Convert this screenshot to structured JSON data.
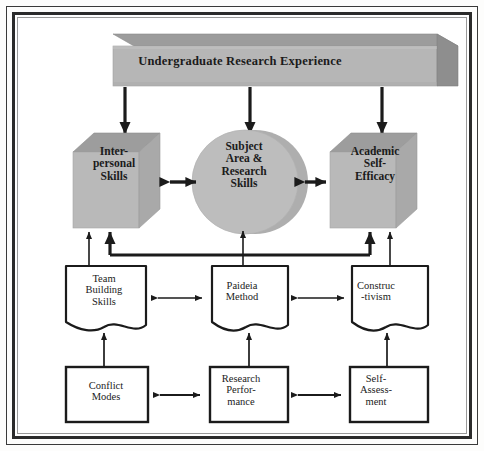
{
  "diagram": {
    "colors": {
      "slab_front": "#b7b7b7",
      "slab_top": "#9a9a9a",
      "slab_side": "#8d8d8d",
      "cube_front": "#b9b9b9",
      "cube_top": "#9d9d9d",
      "cube_side": "#a8a8a8",
      "cylinder_fill": "#bdbdbd",
      "cylinder_shadow": "#a6a6a6",
      "doc_fill": "#ffffff",
      "stroke": "#1b1b1b",
      "frame": "#2b2b2b",
      "text": "#1b1b1b"
    },
    "top_node": {
      "id": "undergraduate-research-experience",
      "label": "Undergraduate Research Experience",
      "shape": "3d-slab"
    },
    "outcome_nodes": [
      {
        "id": "interpersonal-skills",
        "label": "Inter-\npersonal\nSkills",
        "shape": "3d-cube"
      },
      {
        "id": "subject-area-research-skills",
        "label": "Subject\nArea &\nResearch\nSkills",
        "shape": "3d-cylinder"
      },
      {
        "id": "academic-self-efficacy",
        "label": "Academic\nSelf-\nEfficacy",
        "shape": "3d-cube"
      }
    ],
    "method_nodes": [
      {
        "id": "team-building-skills",
        "label": "Team\nBuilding\nSkills",
        "shape": "document"
      },
      {
        "id": "paideia-method",
        "label": "Paideia\nMethod",
        "shape": "document"
      },
      {
        "id": "constructivism",
        "label": "Construc\n-tivism",
        "shape": "document"
      }
    ],
    "measure_nodes": [
      {
        "id": "conflict-modes",
        "label": "Conflict\nModes",
        "shape": "rectangle"
      },
      {
        "id": "research-performance",
        "label": "Research\nPerfor-\nmance",
        "shape": "rectangle"
      },
      {
        "id": "self-assessment",
        "label": "Self-\nAssess-\nment",
        "shape": "rectangle"
      }
    ],
    "connections": [
      {
        "from": "undergraduate-research-experience",
        "to": "interpersonal-skills",
        "type": "arrow-down"
      },
      {
        "from": "undergraduate-research-experience",
        "to": "subject-area-research-skills",
        "type": "arrow-down"
      },
      {
        "from": "undergraduate-research-experience",
        "to": "academic-self-efficacy",
        "type": "arrow-down"
      },
      {
        "from": "interpersonal-skills",
        "to": "subject-area-research-skills",
        "type": "double-arrow"
      },
      {
        "from": "subject-area-research-skills",
        "to": "academic-self-efficacy",
        "type": "double-arrow"
      },
      {
        "from": "team-building-skills",
        "to": "interpersonal-skills",
        "type": "arrow-up"
      },
      {
        "from": "paideia-method",
        "to": "subject-area-research-skills",
        "type": "arrow-up"
      },
      {
        "from": "constructivism",
        "to": "academic-self-efficacy",
        "type": "arrow-up"
      },
      {
        "from": "paideia-method",
        "to": "interpersonal-skills",
        "type": "bus-arrow-up-left"
      },
      {
        "from": "paideia-method",
        "to": "academic-self-efficacy",
        "type": "bus-arrow-up-right"
      },
      {
        "from": "team-building-skills",
        "to": "paideia-method",
        "type": "double-arrow"
      },
      {
        "from": "paideia-method",
        "to": "constructivism",
        "type": "double-arrow"
      },
      {
        "from": "conflict-modes",
        "to": "team-building-skills",
        "type": "arrow-up"
      },
      {
        "from": "research-performance",
        "to": "paideia-method",
        "type": "arrow-up"
      },
      {
        "from": "self-assessment",
        "to": "constructivism",
        "type": "arrow-up"
      },
      {
        "from": "conflict-modes",
        "to": "research-performance",
        "type": "double-arrow"
      },
      {
        "from": "research-performance",
        "to": "self-assessment",
        "type": "double-arrow"
      }
    ]
  }
}
